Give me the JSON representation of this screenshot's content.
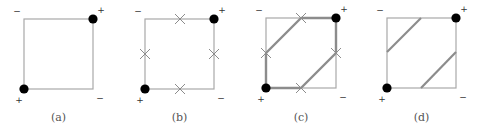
{
  "figure": {
    "panels": [
      {
        "id": "a",
        "caption": "(a)",
        "square": {
          "x1": 24,
          "y1": 19,
          "x2": 93,
          "y2": 89
        },
        "signs": {
          "top_left": "−",
          "top_right": "+",
          "bottom_left": "+",
          "bottom_right": "−"
        },
        "dots": [
          [
            24,
            89
          ],
          [
            93,
            19
          ]
        ],
        "crosses": [],
        "thick_paths": [],
        "diagonals": []
      },
      {
        "id": "b",
        "caption": "(b)",
        "square": {
          "x1": 145,
          "y1": 19,
          "x2": 214,
          "y2": 89
        },
        "signs": {
          "top_left": "−",
          "top_right": "+",
          "bottom_left": "+",
          "bottom_right": "−"
        },
        "dots": [
          [
            145,
            89
          ],
          [
            214,
            19
          ]
        ],
        "crosses": [
          [
            180,
            19
          ],
          [
            145,
            54
          ],
          [
            214,
            54
          ],
          [
            180,
            89
          ]
        ],
        "thick_paths": [],
        "diagonals": []
      },
      {
        "id": "c",
        "caption": "(c)",
        "square": {
          "x1": 266,
          "y1": 18,
          "x2": 336,
          "y2": 88
        },
        "signs": {
          "top_left": "−",
          "top_right": "+",
          "bottom_left": "+",
          "bottom_right": "−"
        },
        "dots": [
          [
            266,
            88
          ],
          [
            336,
            18
          ]
        ],
        "crosses": [
          [
            301,
            18
          ],
          [
            266,
            53
          ],
          [
            336,
            53
          ],
          [
            301,
            88
          ]
        ],
        "thick_paths": [
          [
            [
              266,
              88
            ],
            [
              266,
              53
            ],
            [
              301,
              18
            ],
            [
              336,
              18
            ]
          ],
          [
            [
              266,
              88
            ],
            [
              301,
              88
            ],
            [
              336,
              53
            ],
            [
              336,
              18
            ]
          ]
        ],
        "diagonals": []
      },
      {
        "id": "d",
        "caption": "(d)",
        "square": {
          "x1": 387,
          "y1": 18,
          "x2": 456,
          "y2": 88
        },
        "signs": {
          "top_left": "−",
          "top_right": "+",
          "bottom_left": "+",
          "bottom_right": "−"
        },
        "dots": [
          [
            387,
            88
          ],
          [
            456,
            18
          ]
        ],
        "crosses": [],
        "thick_paths": [],
        "diagonals": [
          [
            [
              387,
              52
            ],
            [
              421,
              18
            ]
          ],
          [
            [
              421,
              88
            ],
            [
              456,
              52
            ]
          ]
        ]
      }
    ],
    "colors": {
      "square_stroke": "#a8a8a8",
      "thick_stroke": "#8c8c8c",
      "diagonal_stroke": "#8c8c8c",
      "cross_stroke": "#8c8c8c",
      "dot_fill": "#000000"
    }
  }
}
